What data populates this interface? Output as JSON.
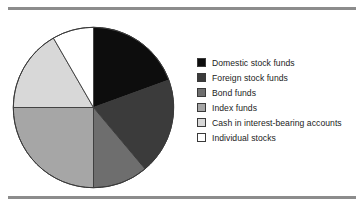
{
  "figure": {
    "background_color": "#ffffff",
    "rule_color": "#8c8c8c",
    "outline_color": "#3a3a3a"
  },
  "legend": {
    "position": "right",
    "items": [
      {
        "label": "Domestic stock funds",
        "color": "#0d0d0d",
        "swatch_name": "legend-swatch-domestic-stock-funds"
      },
      {
        "label": "Foreign stock funds",
        "color": "#3b3b3b",
        "swatch_name": "legend-swatch-foreign-stock-funds"
      },
      {
        "label": "Bond funds",
        "color": "#6e6e6e",
        "swatch_name": "legend-swatch-bond-funds"
      },
      {
        "label": "Index funds",
        "color": "#a6a6a6",
        "swatch_name": "legend-swatch-index-funds"
      },
      {
        "label": "Cash in interest-bearing accounts",
        "color": "#d8d8d8",
        "swatch_name": "legend-swatch-cash-interest-bearing-accounts"
      },
      {
        "label": "Individual stocks",
        "color": "#ffffff",
        "swatch_name": "legend-swatch-individual-stocks"
      }
    ]
  },
  "chart_data": {
    "type": "pie",
    "title": "",
    "xlabel": "",
    "ylabel": "",
    "legend_position": "right",
    "grid": false,
    "start_angle_deg": 0,
    "direction": "clockwise",
    "categories": [
      "Domestic stock funds",
      "Foreign stock funds",
      "Bond funds",
      "Index funds",
      "Cash in interest-bearing accounts",
      "Individual stocks"
    ],
    "values": [
      19.4,
      19.4,
      11.1,
      25.0,
      16.7,
      8.3
    ],
    "angles_deg": [
      70,
      70,
      40,
      90,
      60,
      30
    ],
    "colors": [
      "#0d0d0d",
      "#3b3b3b",
      "#6e6e6e",
      "#a6a6a6",
      "#d8d8d8",
      "#ffffff"
    ],
    "slices": [
      {
        "label": "Domestic stock funds",
        "value": 19.4,
        "angle_deg": 70,
        "start_deg": 0,
        "end_deg": 70,
        "color": "#0d0d0d"
      },
      {
        "label": "Foreign stock funds",
        "value": 19.4,
        "angle_deg": 70,
        "start_deg": 70,
        "end_deg": 140,
        "color": "#3b3b3b"
      },
      {
        "label": "Bond funds",
        "value": 11.1,
        "angle_deg": 40,
        "start_deg": 140,
        "end_deg": 180,
        "color": "#6e6e6e"
      },
      {
        "label": "Index funds",
        "value": 25.0,
        "angle_deg": 90,
        "start_deg": 180,
        "end_deg": 270,
        "color": "#a6a6a6"
      },
      {
        "label": "Cash in interest-bearing accounts",
        "value": 16.7,
        "angle_deg": 60,
        "start_deg": 270,
        "end_deg": 330,
        "color": "#d8d8d8"
      },
      {
        "label": "Individual stocks",
        "value": 8.3,
        "angle_deg": 30,
        "start_deg": 330,
        "end_deg": 360,
        "color": "#ffffff"
      }
    ]
  }
}
